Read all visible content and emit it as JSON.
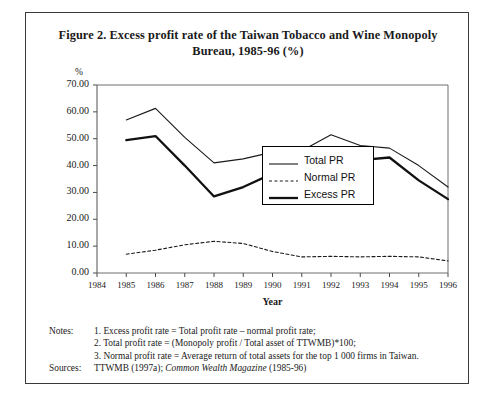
{
  "figure": {
    "title": "Figure 2. Excess profit rate of the Taiwan Tobacco and Wine Monopoly Bureau, 1985-96 (%)"
  },
  "notes": {
    "notes_label": "Notes:",
    "sources_label": "Sources:",
    "items": [
      "1. Excess profit rate = Total profit rate – normal profit rate;",
      "2. Total profit rate = (Monopoly profit / Total asset of TTWMB)*100;",
      "3. Normal profit rate = Average return of total assets for the top 1 000 firms in Taiwan."
    ],
    "sources_text_plain": "TTWMB (1997a); Common Wealth Magazine (1985-96)",
    "sources_prefix": "TTWMB (1997a); ",
    "sources_italic": "Common Wealth Magazine",
    "sources_suffix": " (1985-96)"
  },
  "chart_data": {
    "type": "line",
    "title": "Figure 2. Excess profit rate of the Taiwan Tobacco and Wine Monopoly Bureau, 1985-96 (%)",
    "xlabel": "Year",
    "ylabel": "%",
    "yunit": "%",
    "grid": false,
    "legend_position": "center-right-inside",
    "xlim": [
      1984,
      1996
    ],
    "ylim": [
      0,
      70
    ],
    "ytick_step": 10,
    "ytick_labels": [
      "0.00",
      "10.00",
      "20.00",
      "30.00",
      "40.00",
      "50.00",
      "60.00",
      "70.00"
    ],
    "ytick_values": [
      0,
      10,
      20,
      30,
      40,
      50,
      60,
      70
    ],
    "xtick_labels": [
      "1984",
      "1985",
      "1986",
      "1987",
      "1988",
      "1989",
      "1990",
      "1991",
      "1992",
      "1993",
      "1994",
      "1995",
      "1996"
    ],
    "x": [
      1985,
      1986,
      1987,
      1988,
      1989,
      1990,
      1991,
      1992,
      1993,
      1994,
      1995,
      1996
    ],
    "series": [
      {
        "name": "Total PR",
        "style": "solid-thin",
        "color": "#1a1a1a",
        "values": [
          57.0,
          61.3,
          50.5,
          41.0,
          42.5,
          45.0,
          45.5,
          51.5,
          47.5,
          46.5,
          40.0,
          32.0
        ]
      },
      {
        "name": "Normal PR",
        "style": "dashed",
        "color": "#1a1a1a",
        "values": [
          7.0,
          8.5,
          10.5,
          11.8,
          11.0,
          8.0,
          6.0,
          6.2,
          6.0,
          6.2,
          6.0,
          4.5
        ]
      },
      {
        "name": "Excess PR",
        "style": "solid-thick",
        "color": "#111111",
        "values": [
          49.5,
          51.0,
          40.0,
          28.5,
          32.0,
          37.0,
          39.5,
          45.0,
          42.0,
          43.0,
          34.5,
          27.5
        ]
      }
    ]
  }
}
